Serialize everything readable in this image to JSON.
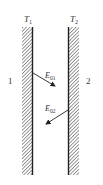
{
  "diagram": {
    "walls": [
      {
        "id": "wall-1",
        "temperature_label": "T",
        "temperature_sub": "1",
        "region_label": "1"
      },
      {
        "id": "wall-2",
        "temperature_label": "T",
        "temperature_sub": "2",
        "region_label": "2"
      }
    ],
    "arrows": [
      {
        "label": "E",
        "sub": "01",
        "direction": "from wall 1 toward wall 2"
      },
      {
        "label": "E",
        "sub": "02",
        "direction": "from wall 2 toward wall 1"
      }
    ],
    "colors": {
      "hatch": "#444444",
      "line": "#222222",
      "text": "#333333"
    }
  }
}
